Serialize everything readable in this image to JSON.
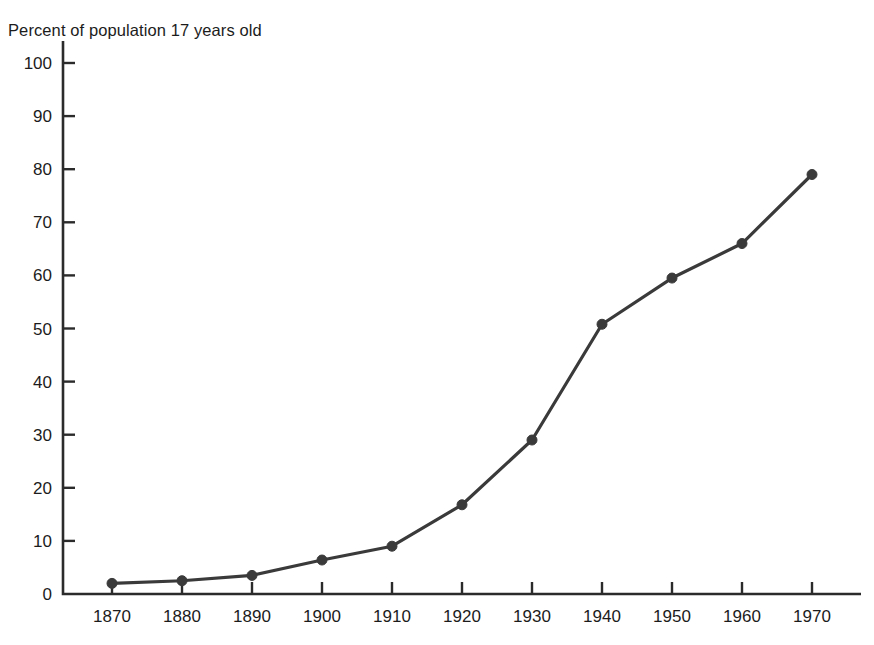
{
  "chart_data": {
    "type": "line",
    "title": "Percent of population 17 years old",
    "xlabel": "",
    "ylabel": "",
    "x": [
      1870,
      1880,
      1890,
      1900,
      1910,
      1920,
      1930,
      1940,
      1950,
      1960,
      1970
    ],
    "categories": [
      "1870",
      "1880",
      "1890",
      "1900",
      "1910",
      "1920",
      "1930",
      "1940",
      "1950",
      "1960",
      "1970"
    ],
    "values": [
      2.0,
      2.5,
      3.5,
      6.4,
      9.0,
      16.8,
      29.0,
      50.8,
      59.5,
      66.0,
      79.0
    ],
    "series": [
      {
        "name": "Percent of population 17 years old",
        "values": [
          2.0,
          2.5,
          3.5,
          6.4,
          9.0,
          16.8,
          29.0,
          50.8,
          59.5,
          66.0,
          79.0
        ]
      }
    ],
    "ylim": [
      0,
      100
    ],
    "xlim": [
      1865,
      1977
    ],
    "ytick_labels": [
      "0",
      "10",
      "20",
      "30",
      "40",
      "50",
      "60",
      "70",
      "80",
      "90",
      "100"
    ],
    "ytick_values": [
      0,
      10,
      20,
      30,
      40,
      50,
      60,
      70,
      80,
      90,
      100
    ],
    "xtick_labels": [
      "1870",
      "1880",
      "1890",
      "1900",
      "1910",
      "1920",
      "1930",
      "1940",
      "1950",
      "1960",
      "1970"
    ],
    "grid": false,
    "legend": false,
    "legend_position": "none",
    "marker": "filled-circle",
    "line_color": "#3a3a3a",
    "marker_color": "#3a3a3a",
    "axis_color": "#2b2b2b",
    "background_color": "#ffffff"
  },
  "axes": {
    "y_ticks": [
      {
        "label": "100",
        "value": 100
      },
      {
        "label": "90",
        "value": 90
      },
      {
        "label": "80",
        "value": 80
      },
      {
        "label": "70",
        "value": 70
      },
      {
        "label": "60",
        "value": 60
      },
      {
        "label": "50",
        "value": 50
      },
      {
        "label": "40",
        "value": 40
      },
      {
        "label": "30",
        "value": 30
      },
      {
        "label": "20",
        "value": 20
      },
      {
        "label": "10",
        "value": 10
      },
      {
        "label": "0",
        "value": 0
      }
    ],
    "x_ticks": [
      {
        "label": "1870",
        "value": 1870
      },
      {
        "label": "1880",
        "value": 1880
      },
      {
        "label": "1890",
        "value": 1890
      },
      {
        "label": "1900",
        "value": 1900
      },
      {
        "label": "1910",
        "value": 1910
      },
      {
        "label": "1920",
        "value": 1920
      },
      {
        "label": "1930",
        "value": 1930
      },
      {
        "label": "1940",
        "value": 1940
      },
      {
        "label": "1950",
        "value": 1950
      },
      {
        "label": "1960",
        "value": 1960
      },
      {
        "label": "1970",
        "value": 1970
      }
    ]
  }
}
